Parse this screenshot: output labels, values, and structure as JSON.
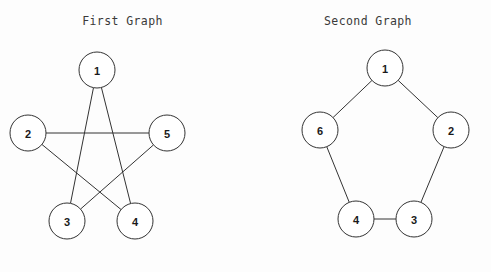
{
  "page": {
    "background_color": "#fdfdfd",
    "width": 491,
    "height": 272
  },
  "style": {
    "edge_color": "#333333",
    "node_fill": "#ffffff",
    "node_stroke": "#333333",
    "label_color": "#1a1a1a",
    "title_color": "#3a3a3a",
    "node_radius": 18,
    "edge_width": 1
  },
  "graphs": [
    {
      "id": "first-graph",
      "title": "First Graph",
      "type": "undirected-graph",
      "layout": "pentagram",
      "node_count": 5,
      "edge_count": 5,
      "nodes": [
        {
          "id": "1",
          "label": "1",
          "cx": 97,
          "cy": 70,
          "r": 18
        },
        {
          "id": "2",
          "label": "2",
          "cx": 28,
          "cy": 133,
          "r": 18
        },
        {
          "id": "5",
          "label": "5",
          "cx": 167,
          "cy": 133,
          "r": 18
        },
        {
          "id": "3",
          "label": "3",
          "cx": 67,
          "cy": 221,
          "r": 18
        },
        {
          "id": "4",
          "label": "4",
          "cx": 135,
          "cy": 221,
          "r": 18
        }
      ],
      "edges": [
        {
          "from": "1",
          "to": "3"
        },
        {
          "from": "1",
          "to": "4"
        },
        {
          "from": "2",
          "to": "5"
        },
        {
          "from": "2",
          "to": "4"
        },
        {
          "from": "3",
          "to": "5"
        }
      ]
    },
    {
      "id": "second-graph",
      "title": "Second Graph",
      "type": "undirected-graph",
      "layout": "pentagon-cycle",
      "node_count": 5,
      "edge_count": 5,
      "nodes": [
        {
          "id": "1",
          "label": "1",
          "cx": 140,
          "cy": 68,
          "r": 18
        },
        {
          "id": "2",
          "label": "2",
          "cx": 206,
          "cy": 130,
          "r": 18
        },
        {
          "id": "6",
          "label": "6",
          "cx": 75,
          "cy": 130,
          "r": 18
        },
        {
          "id": "4",
          "label": "4",
          "cx": 111,
          "cy": 219,
          "r": 18
        },
        {
          "id": "3",
          "label": "3",
          "cx": 169,
          "cy": 219,
          "r": 18
        }
      ],
      "edges": [
        {
          "from": "1",
          "to": "6"
        },
        {
          "from": "1",
          "to": "2"
        },
        {
          "from": "6",
          "to": "4"
        },
        {
          "from": "2",
          "to": "3"
        },
        {
          "from": "4",
          "to": "3"
        }
      ]
    }
  ]
}
